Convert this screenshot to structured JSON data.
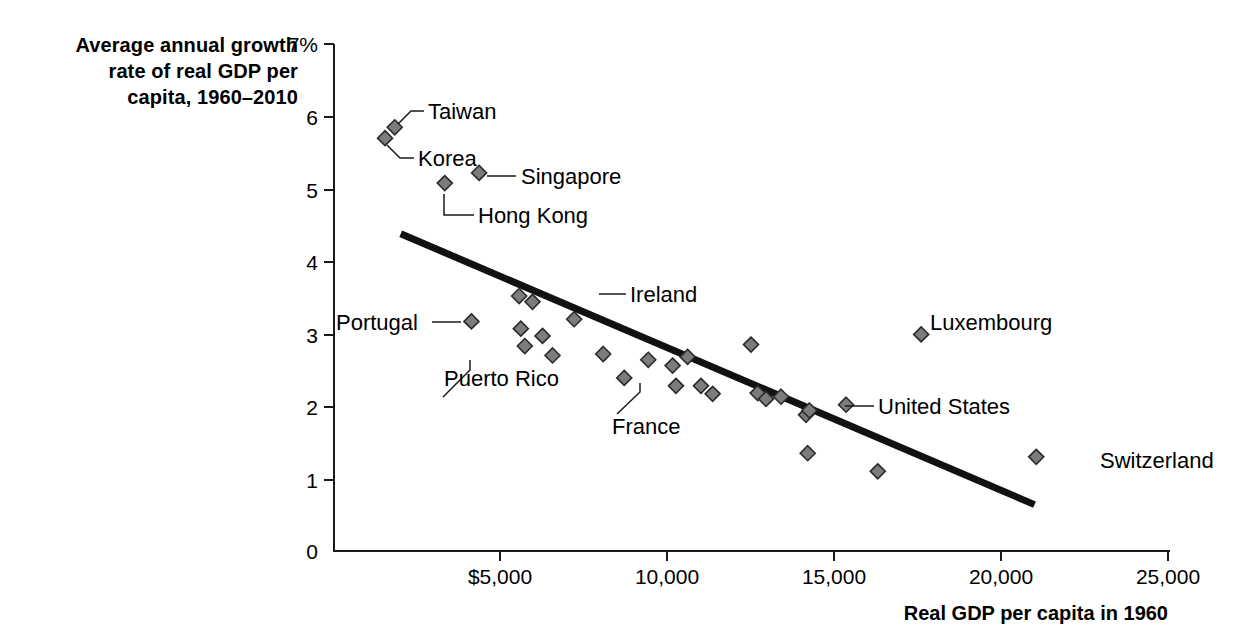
{
  "chart_data": {
    "type": "scatter",
    "title": "",
    "xlabel": "Real GDP per capita in 1960",
    "ylabel": "Average annual growth rate of real GDP per capita, 1960–2010",
    "ylabel_lines": [
      "Average annual growth",
      "rate of real GDP per",
      "capita, 1960–2010"
    ],
    "xlim": [
      0,
      25000
    ],
    "ylim": [
      0,
      7
    ],
    "grid": false,
    "legend": null,
    "x_ticks": [
      0,
      5000,
      10000,
      15000,
      20000,
      25000
    ],
    "x_tick_labels": [
      "0",
      "$5,000",
      "10,000",
      "15,000",
      "20,000",
      "25,000"
    ],
    "y_ticks": [
      0,
      1,
      2,
      3,
      4,
      5,
      6,
      7
    ],
    "y_tick_labels": [
      "0",
      "1",
      "2",
      "3",
      "4",
      "5",
      "6",
      "7%"
    ],
    "marker_color": "#7c7c7c",
    "marker_edge_color": "#2b2b2b",
    "trend_line_color": "#111111",
    "trend_line": {
      "x1": 2000,
      "y1": 4.38,
      "x2": 21000,
      "y2": 0.64
    },
    "points": [
      {
        "label": "Korea",
        "x": 1530,
        "y": 5.7
      },
      {
        "label": "Taiwan",
        "x": 1820,
        "y": 5.85
      },
      {
        "label": "Hong Kong",
        "x": 3320,
        "y": 5.08
      },
      {
        "label": "Singapore",
        "x": 4350,
        "y": 5.22
      },
      {
        "label": "Portugal",
        "x": 4120,
        "y": 3.17
      },
      {
        "label": "",
        "x": 5550,
        "y": 3.52
      },
      {
        "label": "",
        "x": 5950,
        "y": 3.44
      },
      {
        "label": "",
        "x": 5600,
        "y": 3.07
      },
      {
        "label": "Puerto Rico",
        "x": 5720,
        "y": 2.83
      },
      {
        "label": "",
        "x": 6250,
        "y": 2.97
      },
      {
        "label": "",
        "x": 6550,
        "y": 2.7
      },
      {
        "label": "Ireland",
        "x": 7200,
        "y": 3.2
      },
      {
        "label": "",
        "x": 8070,
        "y": 2.72
      },
      {
        "label": "",
        "x": 8700,
        "y": 2.39
      },
      {
        "label": "",
        "x": 9420,
        "y": 2.64
      },
      {
        "label": "",
        "x": 10150,
        "y": 2.56
      },
      {
        "label": "France",
        "x": 10250,
        "y": 2.28
      },
      {
        "label": "",
        "x": 10600,
        "y": 2.68
      },
      {
        "label": "",
        "x": 11000,
        "y": 2.28
      },
      {
        "label": "",
        "x": 11350,
        "y": 2.17
      },
      {
        "label": "",
        "x": 12500,
        "y": 2.85
      },
      {
        "label": "",
        "x": 12700,
        "y": 2.18
      },
      {
        "label": "",
        "x": 12950,
        "y": 2.1
      },
      {
        "label": "",
        "x": 13400,
        "y": 2.13
      },
      {
        "label": "",
        "x": 14150,
        "y": 1.88
      },
      {
        "label": "",
        "x": 14250,
        "y": 1.94
      },
      {
        "label": "",
        "x": 14200,
        "y": 1.35
      },
      {
        "label": "United States",
        "x": 15350,
        "y": 2.02
      },
      {
        "label": "",
        "x": 16300,
        "y": 1.1
      },
      {
        "label": "Luxembourg",
        "x": 17600,
        "y": 2.99
      },
      {
        "label": "Switzerland",
        "x": 21050,
        "y": 1.3
      }
    ],
    "annotations": [
      {
        "text": "Taiwan",
        "point": "Taiwan"
      },
      {
        "text": "Korea",
        "point": "Korea"
      },
      {
        "text": "Singapore",
        "point": "Singapore"
      },
      {
        "text": "Hong Kong",
        "point": "Hong Kong"
      },
      {
        "text": "Portugal",
        "point": "Portugal"
      },
      {
        "text": "Puerto Rico",
        "point": "Puerto Rico"
      },
      {
        "text": "Ireland",
        "point": "Ireland"
      },
      {
        "text": "France",
        "point": "France"
      },
      {
        "text": "Luxembourg",
        "point": "Luxembourg"
      },
      {
        "text": "United States",
        "point": "United States"
      },
      {
        "text": "Switzerland",
        "point": "Switzerland"
      }
    ]
  },
  "labels": {
    "taiwan": "Taiwan",
    "korea": "Korea",
    "singapore": "Singapore",
    "hong_kong": "Hong Kong",
    "portugal": "Portugal",
    "puerto_rico": "Puerto Rico",
    "ireland": "Ireland",
    "france": "France",
    "luxembourg": "Luxembourg",
    "united_states": "United States",
    "switzerland": "Switzerland"
  },
  "axis": {
    "y_title_line1": "Average annual growth",
    "y_title_line2": "rate of real GDP per",
    "y_title_line3": "capita, 1960–2010",
    "x_title": "Real GDP per capita in 1960",
    "y0": "0",
    "y1": "1",
    "y2": "2",
    "y3": "3",
    "y4": "4",
    "y5": "5",
    "y6": "6",
    "y7": "7%",
    "x0": "0",
    "x5000": "$5,000",
    "x10000": "10,000",
    "x15000": "15,000",
    "x20000": "20,000",
    "x25000": "25,000"
  }
}
